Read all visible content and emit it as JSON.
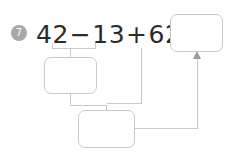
{
  "problem": {
    "number": "7",
    "equation": {
      "full_text": "42−13+62=",
      "terms": [
        "42",
        "−",
        "13",
        "+",
        "62",
        "="
      ],
      "operand_1": "42",
      "operator_1": "−",
      "operand_2": "13",
      "operator_2": "+",
      "operand_3": "62",
      "equals": "="
    },
    "boxes": {
      "answer": {
        "value": "",
        "label": "final-answer"
      },
      "middle": {
        "value": "",
        "label": "partial-42-minus-13"
      },
      "bottom": {
        "value": "",
        "label": "partial-plus-62"
      }
    }
  },
  "colors": {
    "badge_fill": "#a8a8a8",
    "badge_text": "#ffffff",
    "equation_text": "#2b2b2b",
    "line": "#c9c9c9",
    "arrow": "#9a9a9a",
    "background": "#ffffff"
  }
}
